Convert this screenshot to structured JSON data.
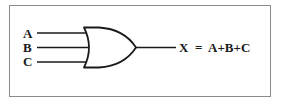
{
  "figure": {
    "kind": "logic-gate-diagram",
    "gate_type": "OR",
    "border_color": "#8a8a8a",
    "line_color": "#1a1a1a",
    "background_color": "#ffffff"
  },
  "inputs": [
    {
      "label": "A"
    },
    {
      "label": "B"
    },
    {
      "label": "C"
    }
  ],
  "output": {
    "equation": "X  =  A+B+C",
    "variable": "X",
    "expression": "A+B+C"
  }
}
